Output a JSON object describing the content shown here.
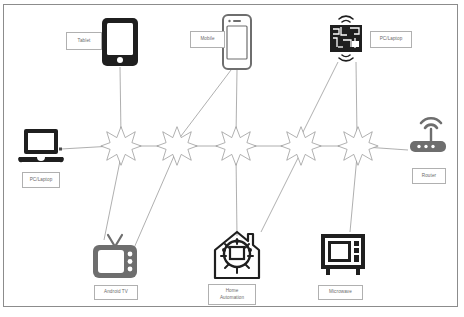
{
  "diagram": {
    "frame": {
      "border_color": "#8c8c8c"
    },
    "colors": {
      "edge": "#9a9a9a",
      "star_outline": "#8a8a8a",
      "dark_icon": "#1f1f1f",
      "mid_icon": "#6e6e6e",
      "label_text": "#6a6a6a",
      "label_border": "#b0b0b0",
      "background": "#ffffff"
    },
    "devices": [
      {
        "id": "tablet",
        "label": "Tablet",
        "icon": "tablet-icon",
        "tone": "dark"
      },
      {
        "id": "mobile",
        "label": "Mobile",
        "icon": "smartphone-icon",
        "tone": "mid"
      },
      {
        "id": "pc-top",
        "label": "PC/Laptop",
        "icon": "circuit-board-icon",
        "tone": "dark"
      },
      {
        "id": "pc-left",
        "label": "PC/Laptop",
        "icon": "laptop-icon",
        "tone": "dark"
      },
      {
        "id": "router",
        "label": "Router",
        "icon": "router-icon",
        "tone": "mid"
      },
      {
        "id": "android-tv",
        "label": "Android TV",
        "icon": "television-icon",
        "tone": "mid"
      },
      {
        "id": "home-auto",
        "label": "Home\nAutomation",
        "icon": "smart-home-icon",
        "tone": "dark"
      },
      {
        "id": "microwave",
        "label": "Microwave",
        "icon": "microwave-icon",
        "tone": "dark"
      }
    ],
    "labels": {
      "tablet": "Tablet",
      "mobile": "Mobile",
      "pc_top": "PC/Laptop",
      "pc_left": "PC/Laptop",
      "router": "Router",
      "android_tv": "Android TV",
      "home_automation_line1": "Home",
      "home_automation_line2": "Automation",
      "microwave": "Microwave"
    },
    "wireless_nodes": [
      {
        "id": "node-1",
        "x": 120,
        "y": 145
      },
      {
        "id": "node-2",
        "x": 176,
        "y": 145
      },
      {
        "id": "node-3",
        "x": 235,
        "y": 145
      },
      {
        "id": "node-4",
        "x": 300,
        "y": 145
      },
      {
        "id": "node-5",
        "x": 357,
        "y": 145
      }
    ],
    "connections": [
      {
        "from": "pc-left",
        "to": "node-1"
      },
      {
        "from": "node-1",
        "to": "node-2"
      },
      {
        "from": "node-2",
        "to": "node-3"
      },
      {
        "from": "node-3",
        "to": "node-4"
      },
      {
        "from": "node-4",
        "to": "node-5"
      },
      {
        "from": "node-5",
        "to": "router"
      },
      {
        "from": "tablet",
        "to": "node-1"
      },
      {
        "from": "node-1",
        "to": "android-tv"
      },
      {
        "from": "node-2",
        "to": "android-tv"
      },
      {
        "from": "mobile",
        "to": "node-2"
      },
      {
        "from": "mobile",
        "to": "node-3"
      },
      {
        "from": "node-3",
        "to": "home-auto"
      },
      {
        "from": "pc-top",
        "to": "node-4"
      },
      {
        "from": "node-4",
        "to": "home-auto"
      },
      {
        "from": "pc-top",
        "to": "node-5"
      },
      {
        "from": "node-5",
        "to": "microwave"
      }
    ]
  }
}
